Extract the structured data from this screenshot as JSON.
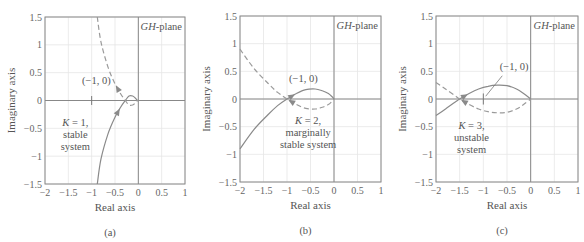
{
  "figure": {
    "panels": [
      {
        "id": "a",
        "caption": "(a)",
        "plane_label_prefix": "GH",
        "plane_label_suffix": "-plane",
        "xlabel": "Real axis",
        "ylabel": "Imaginary axis",
        "point_label": "(−1, 0)",
        "annotation_lines": [
          "K = 1,",
          "stable",
          "system"
        ]
      },
      {
        "id": "b",
        "caption": "(b)",
        "plane_label_prefix": "GH",
        "plane_label_suffix": "-plane",
        "xlabel": "Real axis",
        "ylabel": "Imaginary axis",
        "point_label": "(−1, 0)",
        "annotation_lines": [
          "K = 2,",
          "marginally",
          "stable system"
        ]
      },
      {
        "id": "c",
        "caption": "(c)",
        "plane_label_prefix": "GH",
        "plane_label_suffix": "-plane",
        "xlabel": "Real axis",
        "ylabel": "Imaginary axis",
        "point_label": "(−1, 0)",
        "annotation_lines": [
          "K = 3,",
          "unstable",
          "system"
        ]
      }
    ],
    "x_ticks": [
      "−2",
      "−1.5",
      "−1",
      "−0.5",
      "0",
      "0.5",
      "1"
    ],
    "y_ticks": [
      "1.5",
      "1",
      "0.5",
      "0",
      "−0.5",
      "−1",
      "−1.5"
    ]
  },
  "chart_data": [
    {
      "type": "line",
      "title": "GH-plane, K = 1, stable system",
      "xlabel": "Real axis",
      "ylabel": "Imaginary axis",
      "xlim": [
        -2,
        1
      ],
      "ylim": [
        -1.5,
        1.5
      ],
      "grid": true,
      "annotations": [
        "(−1, 0)",
        "K = 1, stable system"
      ],
      "critical_point": [
        -1,
        0
      ],
      "series": [
        {
          "name": "Nyquist (ω > 0)",
          "style": "solid",
          "x": [
            -0.88,
            -0.8,
            -0.65,
            -0.5,
            -0.38,
            -0.28,
            -0.2,
            -0.12,
            -0.06,
            -0.03,
            0.0
          ],
          "y": [
            -1.5,
            -1.05,
            -0.6,
            -0.3,
            -0.12,
            0.0,
            0.08,
            0.08,
            0.04,
            0.01,
            0.0
          ]
        },
        {
          "name": "Nyquist mirror (ω < 0)",
          "style": "dashed",
          "x": [
            -0.88,
            -0.8,
            -0.65,
            -0.5,
            -0.38,
            -0.28,
            -0.2,
            -0.12,
            -0.06,
            -0.03,
            0.0
          ],
          "y": [
            1.5,
            1.05,
            0.6,
            0.3,
            0.12,
            0.0,
            -0.08,
            -0.08,
            -0.04,
            -0.01,
            0.0
          ]
        }
      ]
    },
    {
      "type": "line",
      "title": "GH-plane, K = 2, marginally stable system",
      "xlabel": "Real axis",
      "ylabel": "Imaginary axis",
      "xlim": [
        -2,
        1
      ],
      "ylim": [
        -1.5,
        1.5
      ],
      "grid": true,
      "annotations": [
        "(−1, 0)",
        "K = 2, marginally stable system"
      ],
      "critical_point": [
        -1,
        0
      ],
      "series": [
        {
          "name": "Nyquist (ω > 0)",
          "style": "solid",
          "x": [
            -2.0,
            -1.7,
            -1.4,
            -1.2,
            -1.0,
            -0.8,
            -0.6,
            -0.4,
            -0.25,
            -0.12,
            -0.04,
            0.0
          ],
          "y": [
            -0.9,
            -0.55,
            -0.28,
            -0.12,
            0.0,
            0.1,
            0.17,
            0.18,
            0.15,
            0.1,
            0.04,
            0.0
          ]
        },
        {
          "name": "Nyquist mirror (ω < 0)",
          "style": "dashed",
          "x": [
            -2.0,
            -1.7,
            -1.4,
            -1.2,
            -1.0,
            -0.8,
            -0.6,
            -0.4,
            -0.25,
            -0.12,
            -0.04,
            0.0
          ],
          "y": [
            0.9,
            0.55,
            0.28,
            0.12,
            0.0,
            -0.1,
            -0.17,
            -0.18,
            -0.15,
            -0.1,
            -0.04,
            0.0
          ]
        }
      ]
    },
    {
      "type": "line",
      "title": "GH-plane, K = 3, unstable system",
      "xlabel": "Real axis",
      "ylabel": "Imaginary axis",
      "xlim": [
        -2,
        1
      ],
      "ylim": [
        -1.5,
        1.5
      ],
      "grid": true,
      "annotations": [
        "(−1, 0)",
        "K = 3, unstable system"
      ],
      "critical_point": [
        -1,
        0
      ],
      "series": [
        {
          "name": "Nyquist (ω > 0)",
          "style": "solid",
          "x": [
            -2.0,
            -1.8,
            -1.6,
            -1.5,
            -1.3,
            -1.1,
            -0.9,
            -0.7,
            -0.5,
            -0.3,
            -0.15,
            0.0
          ],
          "y": [
            -0.3,
            -0.18,
            -0.06,
            0.0,
            0.1,
            0.18,
            0.23,
            0.25,
            0.24,
            0.18,
            0.1,
            0.0
          ]
        },
        {
          "name": "Nyquist mirror (ω < 0)",
          "style": "dashed",
          "x": [
            -2.0,
            -1.8,
            -1.6,
            -1.5,
            -1.3,
            -1.1,
            -0.9,
            -0.7,
            -0.5,
            -0.3,
            -0.15,
            0.0
          ],
          "y": [
            0.3,
            0.18,
            0.06,
            0.0,
            -0.1,
            -0.18,
            -0.23,
            -0.25,
            -0.24,
            -0.18,
            -0.1,
            0.0
          ]
        }
      ]
    }
  ]
}
